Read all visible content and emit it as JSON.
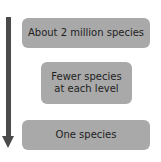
{
  "diagram": {
    "arrow": {
      "direction": "down",
      "color": "#4a4a4a"
    },
    "boxes": [
      {
        "label": "About 2 million species"
      },
      {
        "label": "Fewer species\nat each level"
      },
      {
        "label": "One species"
      }
    ],
    "box_color": "#a9a9a9",
    "text_color": "#1e1e1e"
  }
}
